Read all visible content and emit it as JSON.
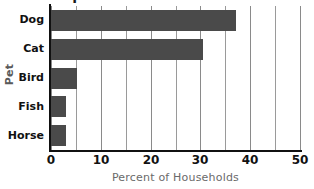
{
  "chart_data": {
    "type": "bar",
    "orientation": "horizontal",
    "title": "Popular Pets",
    "title_clipped": true,
    "xlabel": "Percent of Households",
    "ylabel": "Pet",
    "categories": [
      "Dog",
      "Cat",
      "Bird",
      "Fish",
      "Horse"
    ],
    "values": [
      37.2,
      30.5,
      5.2,
      3.0,
      3.0
    ],
    "xlim": [
      0,
      50
    ],
    "xticks": [
      0,
      10,
      20,
      30,
      40,
      50
    ],
    "xtick_labels": [
      "0",
      "10",
      "20",
      "30",
      "40",
      "50"
    ],
    "minor_tick_step": 5,
    "grid": "vertical",
    "legend": null,
    "bar_color": "#4a4a4a",
    "gridline_color": "#9a9a9a",
    "axis_color": "#111111",
    "axis_label_color": "#6a6a6a",
    "background_color": "#ffffff"
  }
}
